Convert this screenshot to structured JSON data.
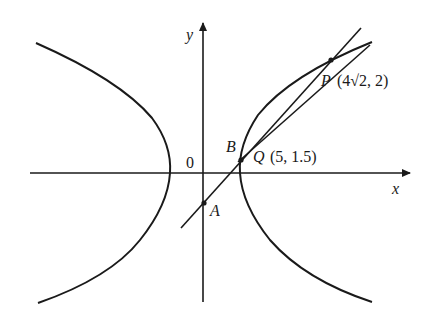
{
  "figure": {
    "type": "hyperbola-with-lines",
    "axes": {
      "x_label": "x",
      "y_label": "y",
      "origin_label": "0"
    },
    "points": {
      "P": {
        "name": "P",
        "coords": "(4√2, 2)"
      },
      "Q": {
        "name": "Q",
        "coords": "(5, 1.5)"
      },
      "A": {
        "name": "A"
      },
      "B": {
        "name": "B"
      }
    },
    "colors": {
      "stroke": "#1a1a1a",
      "background": "#ffffff"
    }
  }
}
